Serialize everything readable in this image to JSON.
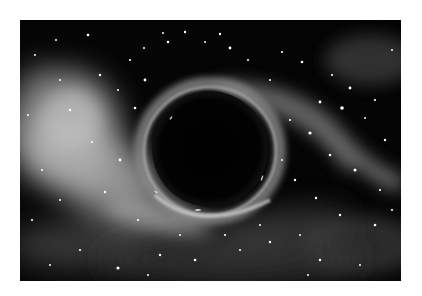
{
  "image": {
    "subject": "black hole in space",
    "description": "Grayscale illustration of a black hole with a glowing accretion ring, surrounded by nebula clouds and scattered stars",
    "colors": {
      "background": "#ffffff",
      "space": "#050505",
      "nebula": "#bdbdbd",
      "ring": "#9a9a9a",
      "stars": "#ffffff",
      "hole": "#000000"
    },
    "frame": {
      "x": 20,
      "y": 20,
      "width": 381,
      "height": 261
    },
    "black_hole": {
      "cx": 190,
      "cy": 131,
      "r": 58,
      "ring_r": 68
    }
  }
}
